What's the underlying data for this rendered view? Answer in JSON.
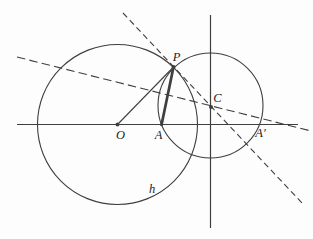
{
  "diagram": {
    "colors": {
      "background": "#fdfdfd",
      "stroke": "#3f3f3f",
      "label_text": "#222222"
    },
    "labels": {
      "large_circle_center": "O",
      "point_on_axis": "A",
      "inverse_point": "A′",
      "small_circle_center": "C",
      "circles_intersection": "P",
      "large_circle_name": "h"
    }
  }
}
